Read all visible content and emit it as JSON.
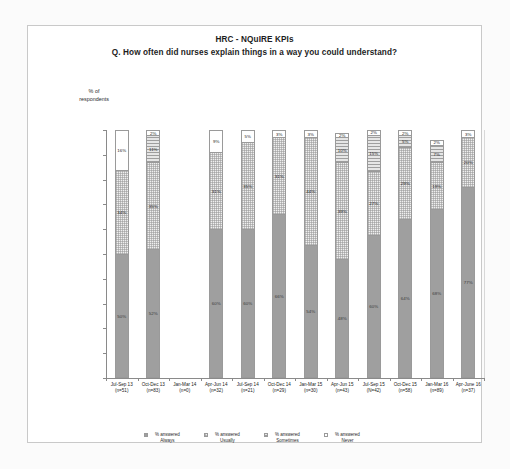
{
  "title": {
    "line1": "HRC - NQuIRE KPIs",
    "line2": "Q. How often did nurses explain things in a way you could understand?"
  },
  "axis": {
    "y_caption_line1": "% of",
    "y_caption_line2": "respondents",
    "y_ticks": [
      "100%",
      "90%",
      "80%",
      "70%",
      "60%",
      "50%",
      "40%",
      "30%",
      "20%",
      "10%",
      "0%"
    ]
  },
  "legend": [
    {
      "swatch": "legend-swatch-always",
      "line1": "% answered",
      "line2": "Always"
    },
    {
      "swatch": "legend-swatch-usually",
      "line1": "% answered",
      "line2": "Usually"
    },
    {
      "swatch": "legend-swatch-sometimes",
      "line1": "% answered",
      "line2": "Sometimes"
    },
    {
      "swatch": "legend-swatch-never",
      "line1": "% answered",
      "line2": "Never"
    }
  ],
  "chart_data": {
    "type": "bar",
    "subtype": "100% stacked column",
    "title": "HRC - NQuIRE KPIs  Q. How often did nurses explain things in a way you could understand?",
    "xlabel": "",
    "ylabel": "% of respondents",
    "ylim": [
      0,
      100
    ],
    "y_tick_step": 10,
    "grid": false,
    "legend_position": "bottom",
    "categories": [
      "Jul-Sep 13",
      "Oct-Dec 13",
      "Jan-Mar 14",
      "Apr-Jun 14",
      "Jul-Sep 14",
      "Oct-Dec 14",
      "Jan-Mar 15",
      "Apr-Jun 15",
      "Jul-Sep 15",
      "Oct-Dec 15",
      "Jan-Mar 16",
      "Apr-June 16"
    ],
    "category_sublabels": [
      "(n=51)",
      "(n=83)",
      "(n=0)",
      "(n=32)",
      "(n=21)",
      "(n=29)",
      "(n=30)",
      "(n=43)",
      "(N=42)",
      "(n=58)",
      "(n=89)",
      "(n=37)"
    ],
    "series": [
      {
        "name": "% answered Always",
        "values": [
          50,
          52,
          null,
          60,
          60,
          66,
          54,
          48,
          60,
          64,
          68,
          77
        ]
      },
      {
        "name": "% answered Usually",
        "values": [
          34,
          35,
          null,
          31,
          35,
          31,
          44,
          39,
          27,
          29,
          19,
          20
        ]
      },
      {
        "name": "% answered Sometimes",
        "values": [
          0,
          11,
          null,
          0,
          0,
          0,
          0,
          10,
          15,
          5,
          7,
          0
        ]
      },
      {
        "name": "% answered Never",
        "values": [
          16,
          2,
          null,
          9,
          5,
          3,
          3,
          2,
          2,
          2,
          2,
          3
        ]
      }
    ],
    "bars": [
      {
        "category": "Jul-Sep 13",
        "n": "(n=51)",
        "empty": false,
        "segments": [
          {
            "series": "Always",
            "value": 50,
            "label": "50%"
          },
          {
            "series": "Usually",
            "value": 34,
            "label": "34%"
          },
          {
            "series": "Sometimes",
            "value": 0,
            "label": ""
          },
          {
            "series": "Never",
            "value": 16,
            "label": "16%"
          }
        ]
      },
      {
        "category": "Oct-Dec 13",
        "n": "(n=83)",
        "empty": false,
        "segments": [
          {
            "series": "Always",
            "value": 52,
            "label": "52%"
          },
          {
            "series": "Usually",
            "value": 35,
            "label": "35%"
          },
          {
            "series": "Sometimes",
            "value": 11,
            "label": "11%"
          },
          {
            "series": "Never",
            "value": 2,
            "label": "2%"
          }
        ]
      },
      {
        "category": "Jan-Mar 14",
        "n": "(n=0)",
        "empty": true,
        "segments": []
      },
      {
        "category": "Apr-Jun 14",
        "n": "(n=32)",
        "empty": false,
        "segments": [
          {
            "series": "Always",
            "value": 60,
            "label": "60%"
          },
          {
            "series": "Usually",
            "value": 31,
            "label": "31%"
          },
          {
            "series": "Sometimes",
            "value": 0,
            "label": ""
          },
          {
            "series": "Never",
            "value": 9,
            "label": "9%"
          }
        ]
      },
      {
        "category": "Jul-Sep 14",
        "n": "(n=21)",
        "empty": false,
        "segments": [
          {
            "series": "Always",
            "value": 60,
            "label": "60%"
          },
          {
            "series": "Usually",
            "value": 35,
            "label": "35%"
          },
          {
            "series": "Sometimes",
            "value": 0,
            "label": ""
          },
          {
            "series": "Never",
            "value": 5,
            "label": "5%"
          }
        ]
      },
      {
        "category": "Oct-Dec 14",
        "n": "(n=29)",
        "empty": false,
        "segments": [
          {
            "series": "Always",
            "value": 66,
            "label": "66%"
          },
          {
            "series": "Usually",
            "value": 31,
            "label": "31%"
          },
          {
            "series": "Sometimes",
            "value": 0,
            "label": ""
          },
          {
            "series": "Never",
            "value": 3,
            "label": "3%"
          }
        ]
      },
      {
        "category": "Jan-Mar 15",
        "n": "(n=30)",
        "empty": false,
        "segments": [
          {
            "series": "Always",
            "value": 54,
            "label": "54%"
          },
          {
            "series": "Usually",
            "value": 44,
            "label": "44%"
          },
          {
            "series": "Sometimes",
            "value": 0,
            "label": ""
          },
          {
            "series": "Never",
            "value": 3,
            "label": "3%"
          }
        ]
      },
      {
        "category": "Apr-Jun 15",
        "n": "(n=43)",
        "empty": false,
        "segments": [
          {
            "series": "Always",
            "value": 48,
            "label": "48%"
          },
          {
            "series": "Usually",
            "value": 39,
            "label": "39%"
          },
          {
            "series": "Sometimes",
            "value": 10,
            "label": "10%"
          },
          {
            "series": "Never",
            "value": 2,
            "label": "2%"
          }
        ]
      },
      {
        "category": "Jul-Sep 15",
        "n": "(N=42)",
        "empty": false,
        "segments": [
          {
            "series": "Always",
            "value": 60,
            "label": "60%"
          },
          {
            "series": "Usually",
            "value": 27,
            "label": "27%"
          },
          {
            "series": "Sometimes",
            "value": 15,
            "label": "15%"
          },
          {
            "series": "Never",
            "value": 2,
            "label": "2%"
          }
        ]
      },
      {
        "category": "Oct-Dec 15",
        "n": "(n=58)",
        "empty": false,
        "segments": [
          {
            "series": "Always",
            "value": 64,
            "label": "64%"
          },
          {
            "series": "Usually",
            "value": 29,
            "label": "29%"
          },
          {
            "series": "Sometimes",
            "value": 5,
            "label": "5%"
          },
          {
            "series": "Never",
            "value": 2,
            "label": "2%"
          }
        ]
      },
      {
        "category": "Jan-Mar 16",
        "n": "(n=89)",
        "empty": false,
        "segments": [
          {
            "series": "Always",
            "value": 68,
            "label": "68%"
          },
          {
            "series": "Usually",
            "value": 19,
            "label": "19%"
          },
          {
            "series": "Sometimes",
            "value": 7,
            "label": "7%"
          },
          {
            "series": "Never",
            "value": 2,
            "label": "2%"
          }
        ]
      },
      {
        "category": "Apr-June 16",
        "n": "(n=37)",
        "empty": false,
        "segments": [
          {
            "series": "Always",
            "value": 77,
            "label": "77%"
          },
          {
            "series": "Usually",
            "value": 20,
            "label": "20%"
          },
          {
            "series": "Sometimes",
            "value": 0,
            "label": ""
          },
          {
            "series": "Never",
            "value": 3,
            "label": "3%"
          }
        ]
      }
    ]
  }
}
